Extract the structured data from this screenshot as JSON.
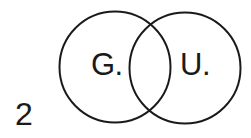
{
  "figure": {
    "number": "2",
    "type": "venn-diagram",
    "stroke_color": "#1a1a1a",
    "background": "#ffffff",
    "sets": [
      {
        "label": "G.",
        "cx": 115,
        "cy": 67,
        "r": 56
      },
      {
        "label": "U.",
        "cx": 185,
        "cy": 68,
        "r": 56
      }
    ]
  }
}
